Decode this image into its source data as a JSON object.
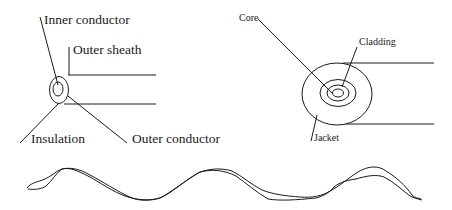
{
  "diagram": {
    "coaxial_cable": {
      "labels": {
        "inner_conductor": "Inner conductor",
        "outer_sheath": "Outer sheath",
        "insulation": "Insulation",
        "outer_conductor": "Outer conductor"
      }
    },
    "optical_fiber": {
      "labels": {
        "core": "Core",
        "cladding": "Cladding",
        "jacket": "Jacket"
      }
    },
    "twisted_pair": {
      "description": "two intertwined wavy wires"
    },
    "colors": {
      "stroke": "#1a1a1a",
      "background": "#ffffff"
    }
  }
}
